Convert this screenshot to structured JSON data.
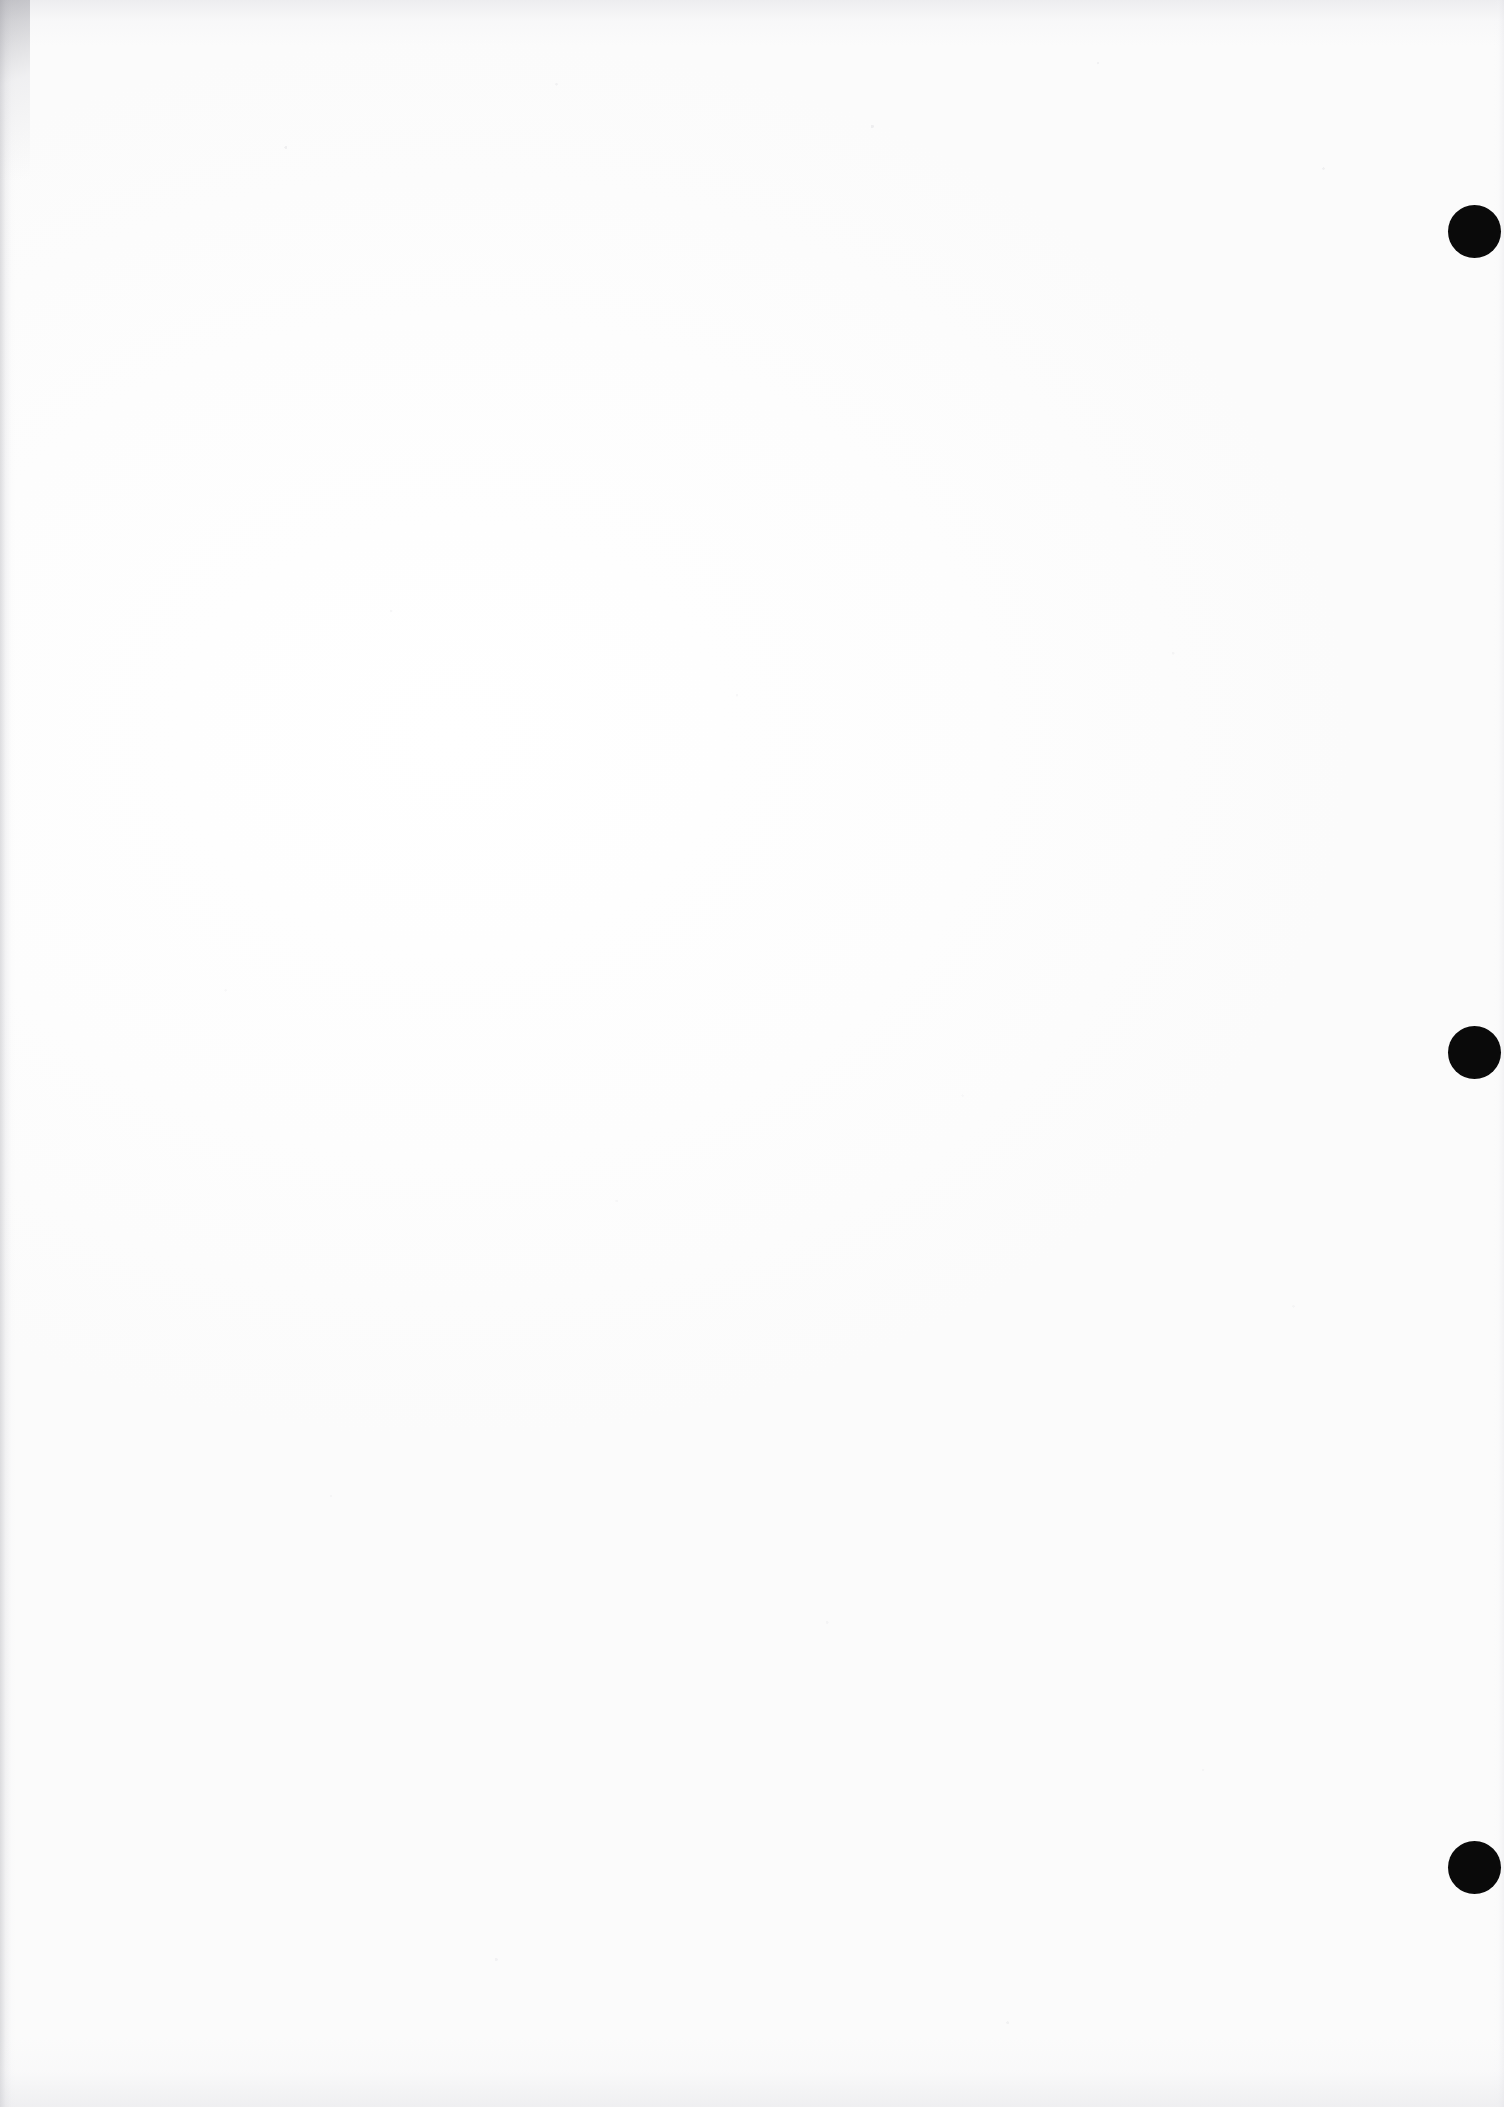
{
  "document": {
    "type": "scanned-page",
    "title": "Blank scanned page with register marks",
    "page_width": 1504,
    "page_height": 2107,
    "background_color": "#fefefe",
    "has_text": false,
    "body_text": ""
  },
  "marks": {
    "label": "register-marks",
    "color": "#0a0a0a",
    "count": 3,
    "items": [
      {
        "name": "register-mark-top",
        "cx": 1474,
        "cy": 231,
        "diameter": 53
      },
      {
        "name": "register-mark-middle",
        "cx": 1474,
        "cy": 1052,
        "diameter": 53
      },
      {
        "name": "register-mark-bottom",
        "cx": 1474,
        "cy": 1867,
        "diameter": 53
      }
    ]
  },
  "edges": {
    "left_vignette_color": "#b0b0b6",
    "top_band_color": "#d6d6dc",
    "bottom_band_color": "#d8d8de",
    "right_band_color": "#dedee4"
  }
}
